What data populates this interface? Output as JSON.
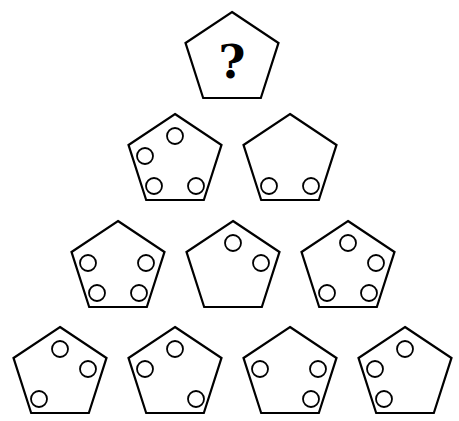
{
  "puzzle": {
    "question_mark": "?",
    "colors": {
      "stroke": "#000000",
      "fill": "#ffffff"
    },
    "pentagon": {
      "width": 93,
      "height": 86
    },
    "rows": [
      {
        "row": 1,
        "pentagons": [
          {
            "id": "top",
            "cx": 232,
            "top": 12,
            "circles": [],
            "content": "?"
          }
        ]
      },
      {
        "row": 2,
        "pentagons": [
          {
            "id": "r2p1",
            "cx": 175,
            "top": 114,
            "circles": [
              "top",
              "upper-left",
              "bottom-left",
              "bottom-right"
            ]
          },
          {
            "id": "r2p2",
            "cx": 290,
            "top": 114,
            "circles": [
              "bottom-left",
              "bottom-right"
            ]
          }
        ]
      },
      {
        "row": 3,
        "pentagons": [
          {
            "id": "r3p1",
            "cx": 118,
            "top": 221,
            "circles": [
              "upper-left",
              "upper-right",
              "bottom-left",
              "bottom-right"
            ]
          },
          {
            "id": "r3p2",
            "cx": 233,
            "top": 221,
            "circles": [
              "top",
              "upper-right"
            ]
          },
          {
            "id": "r3p3",
            "cx": 348,
            "top": 221,
            "circles": [
              "top",
              "upper-right",
              "bottom-left",
              "bottom-right"
            ]
          }
        ]
      },
      {
        "row": 4,
        "pentagons": [
          {
            "id": "r4p1",
            "cx": 60,
            "top": 327,
            "circles": [
              "top",
              "upper-right",
              "bottom-left"
            ]
          },
          {
            "id": "r4p2",
            "cx": 175,
            "top": 327,
            "circles": [
              "top",
              "upper-left",
              "bottom-right"
            ]
          },
          {
            "id": "r4p3",
            "cx": 290,
            "top": 327,
            "circles": [
              "upper-left",
              "upper-right",
              "bottom-right"
            ]
          },
          {
            "id": "r4p4",
            "cx": 405,
            "top": 327,
            "circles": [
              "top",
              "upper-left",
              "bottom-left"
            ]
          }
        ]
      }
    ]
  }
}
